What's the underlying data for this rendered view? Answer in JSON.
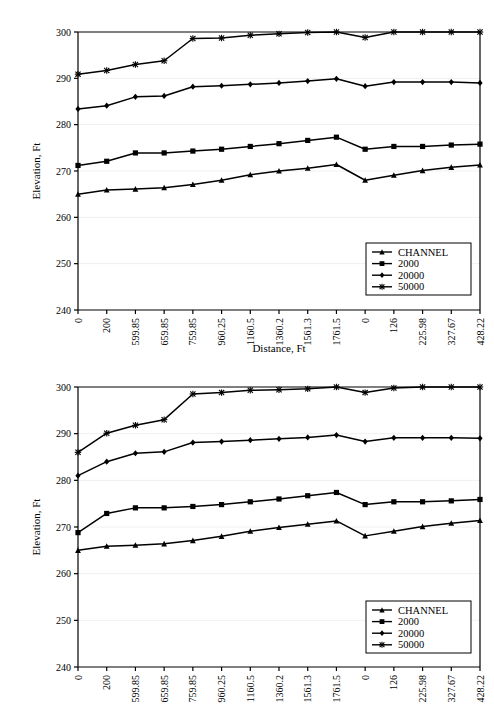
{
  "figures": [
    {
      "id": "figure-1",
      "axis": {
        "ylabel": "Elevation, Ft",
        "xlabel": "Distance, Ft",
        "ylim": [
          240,
          300
        ],
        "yticks": [
          "240",
          "250",
          "260",
          "270",
          "280",
          "290",
          "300"
        ],
        "xticks": [
          "0",
          "200",
          "599.85",
          "659.85",
          "759.85",
          "960.25",
          "1160.5",
          "1360.2",
          "1561.3",
          "1761.5",
          "0",
          "126",
          "225.98",
          "327.67",
          "428.22"
        ]
      },
      "legend": {
        "items": [
          {
            "label": "CHANNEL",
            "marker": "triangle"
          },
          {
            "label": "2000",
            "marker": "square"
          },
          {
            "label": "20000",
            "marker": "diamond"
          },
          {
            "label": "50000",
            "marker": "star"
          }
        ]
      },
      "chart_data": {
        "type": "line",
        "title": "",
        "xlabel": "Distance, Ft",
        "ylabel": "Elevation, Ft",
        "ylim": [
          240,
          300
        ],
        "grid": true,
        "legend_position": "bottom-right",
        "categories": [
          "0",
          "200",
          "599.85",
          "659.85",
          "759.85",
          "960.25",
          "1160.5",
          "1360.2",
          "1561.3",
          "1761.5",
          "0",
          "126",
          "225.98",
          "327.67",
          "428.22"
        ],
        "series": [
          {
            "name": "CHANNEL",
            "marker": "triangle",
            "values": [
              265.0,
              265.9,
              266.1,
              266.4,
              267.1,
              268.0,
              269.2,
              270.0,
              270.6,
              271.4,
              268.0,
              269.1,
              270.1,
              270.8,
              271.3
            ]
          },
          {
            "name": "2000",
            "marker": "square",
            "values": [
              271.2,
              272.1,
              273.9,
              273.9,
              274.3,
              274.7,
              275.3,
              275.9,
              276.6,
              277.3,
              274.7,
              275.3,
              275.3,
              275.6,
              275.8
            ]
          },
          {
            "name": "20000",
            "marker": "diamond",
            "values": [
              283.4,
              284.1,
              286.0,
              286.2,
              288.2,
              288.4,
              288.7,
              289.0,
              289.4,
              289.9,
              288.3,
              289.2,
              289.2,
              289.2,
              289.0
            ]
          },
          {
            "name": "50000",
            "marker": "star",
            "values": [
              290.9,
              291.7,
              293.0,
              293.8,
              298.6,
              298.7,
              299.3,
              299.6,
              299.9,
              300.0,
              298.8,
              300.0,
              300.0,
              300.0,
              300.0
            ]
          }
        ]
      }
    },
    {
      "id": "figure-2",
      "axis": {
        "ylabel": "Elevation, Ft",
        "xlabel": "Distance, Ft",
        "ylim": [
          240,
          300
        ],
        "yticks": [
          "240",
          "250",
          "260",
          "270",
          "280",
          "290",
          "300"
        ],
        "xticks": [
          "0",
          "200",
          "599.85",
          "659.85",
          "759.85",
          "960.25",
          "1160.5",
          "1360.2",
          "1561.3",
          "1761.5",
          "0",
          "126",
          "225.98",
          "327.67",
          "428.22"
        ]
      },
      "legend": {
        "items": [
          {
            "label": "CHANNEL",
            "marker": "triangle"
          },
          {
            "label": "2000",
            "marker": "square"
          },
          {
            "label": "20000",
            "marker": "diamond"
          },
          {
            "label": "50000",
            "marker": "star"
          }
        ]
      },
      "chart_data": {
        "type": "line",
        "title": "",
        "xlabel": "Distance, Ft",
        "ylabel": "Elevation, Ft",
        "ylim": [
          240,
          300
        ],
        "grid": true,
        "legend_position": "bottom-right",
        "categories": [
          "0",
          "200",
          "599.85",
          "659.85",
          "759.85",
          "960.25",
          "1160.5",
          "1360.2",
          "1561.3",
          "1761.5",
          "0",
          "126",
          "225.98",
          "327.67",
          "428.22"
        ],
        "series": [
          {
            "name": "CHANNEL",
            "marker": "triangle",
            "values": [
              265.0,
              265.9,
              266.1,
              266.4,
              267.1,
              268.0,
              269.1,
              269.9,
              270.6,
              271.3,
              268.1,
              269.1,
              270.1,
              270.8,
              271.4
            ]
          },
          {
            "name": "2000",
            "marker": "square",
            "values": [
              268.8,
              272.9,
              274.1,
              274.1,
              274.4,
              274.8,
              275.4,
              276.0,
              276.7,
              277.4,
              274.8,
              275.4,
              275.4,
              275.6,
              275.9
            ]
          },
          {
            "name": "20000",
            "marker": "diamond",
            "values": [
              281.0,
              284.0,
              285.8,
              286.1,
              288.1,
              288.3,
              288.6,
              288.9,
              289.2,
              289.7,
              288.3,
              289.1,
              289.1,
              289.1,
              289.0
            ]
          },
          {
            "name": "50000",
            "marker": "star",
            "values": [
              286.0,
              290.1,
              291.8,
              293.0,
              298.5,
              298.8,
              299.3,
              299.4,
              299.6,
              300.0,
              298.8,
              299.8,
              300.0,
              300.0,
              300.0
            ]
          }
        ]
      }
    }
  ]
}
